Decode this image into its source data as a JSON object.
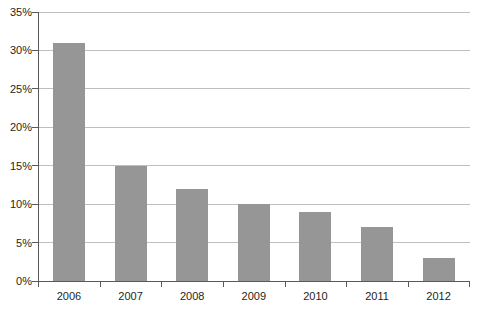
{
  "chart_data": {
    "type": "bar",
    "title": "",
    "subtitle": "",
    "xlabel": "",
    "ylabel": "",
    "categories": [
      "2006",
      "2007",
      "2008",
      "2009",
      "2010",
      "2011",
      "2012"
    ],
    "values": [
      31,
      15,
      12,
      10,
      9,
      7,
      3
    ],
    "value_labels": [
      "31%",
      "15%",
      "12%",
      "10%",
      "9%",
      "7%",
      "3%"
    ],
    "series": [
      {
        "name": "",
        "values": [
          31,
          15,
          12,
          10,
          9,
          7,
          3
        ]
      }
    ],
    "ylim": [
      0,
      35
    ],
    "ytick_step": 5,
    "ytick_values": [
      0,
      5,
      10,
      15,
      20,
      25,
      30,
      35
    ],
    "ytick_labels": [
      "0%",
      "5%",
      "10%",
      "15%",
      "20%",
      "25%",
      "30%",
      "35%"
    ],
    "grid": true,
    "grid_axis": "y",
    "legend": false,
    "legend_position": "none",
    "annotations": [],
    "colors": {
      "bar_fill": "#969696",
      "gridline": "#bfbfbf",
      "axis_line": "#58595b",
      "tick_label": "#231f20",
      "background": "#ffffff"
    }
  }
}
